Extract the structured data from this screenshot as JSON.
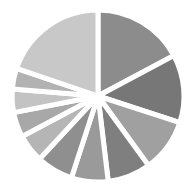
{
  "chart_data": {
    "type": "pie",
    "title": "",
    "start_angle_deg": 0,
    "direction": "clockwise",
    "legend": "none",
    "labels": "none",
    "categories": [
      "S1",
      "S2",
      "S3",
      "S4",
      "S5",
      "S6",
      "S7",
      "S8",
      "S9",
      "S10",
      "S11"
    ],
    "values": [
      17.2,
      12.8,
      10.0,
      8.1,
      6.9,
      6.9,
      5.3,
      4.7,
      4.4,
      3.9,
      19.8
    ],
    "colors": [
      "#8c8c8c",
      "#777777",
      "#a0a0a0",
      "#7f7f7f",
      "#9a9a9a",
      "#8f8f8f",
      "#b5b5b5",
      "#a8a8a8",
      "#c3c3c3",
      "#b2b2b2",
      "#c8c8c8"
    ],
    "gap_color": "#ffffff",
    "center": [
      98,
      96
    ],
    "radius": 86
  }
}
